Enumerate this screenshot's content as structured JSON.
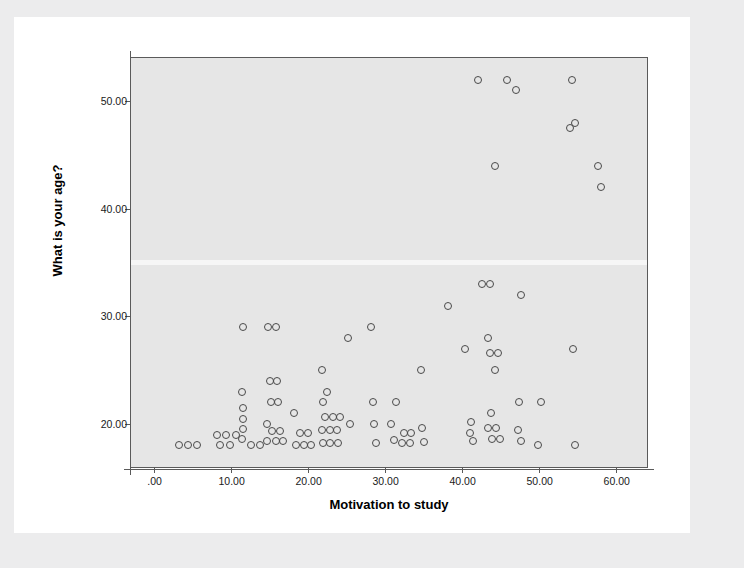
{
  "chart_data": {
    "type": "scatter",
    "title": "",
    "xlabel": "Motivation to study",
    "ylabel": "What is your age?",
    "xlim": [
      -3,
      64
    ],
    "ylim": [
      16,
      54
    ],
    "grid": false,
    "legend": null,
    "xticks": [
      ".00",
      "10.00",
      "20.00",
      "30.00",
      "40.00",
      "50.00",
      "60.00"
    ],
    "xtick_values": [
      0,
      10,
      20,
      30,
      40,
      50,
      60
    ],
    "yticks": [
      "20.00",
      "30.00",
      "40.00",
      "50.00"
    ],
    "ytick_values": [
      20,
      30,
      40,
      50
    ],
    "marker": "open-circle",
    "marker_color": "#4a4a4a",
    "plot_background": "#e6e6e6",
    "points": [
      [
        3.2,
        18
      ],
      [
        4.4,
        18
      ],
      [
        5.6,
        18
      ],
      [
        8.2,
        19
      ],
      [
        9.4,
        19
      ],
      [
        10.6,
        19
      ],
      [
        8.6,
        18
      ],
      [
        9.8,
        18
      ],
      [
        11.6,
        29
      ],
      [
        11.4,
        23
      ],
      [
        11.6,
        21.5
      ],
      [
        11.5,
        20.5
      ],
      [
        11.5,
        19.5
      ],
      [
        11.4,
        18.6
      ],
      [
        12.6,
        18
      ],
      [
        13.8,
        18
      ],
      [
        14.8,
        29
      ],
      [
        15.8,
        29
      ],
      [
        15.0,
        24
      ],
      [
        15.9,
        24
      ],
      [
        15.2,
        22
      ],
      [
        16.1,
        22
      ],
      [
        14.6,
        20
      ],
      [
        15.3,
        19.3
      ],
      [
        16.3,
        19.3
      ],
      [
        14.7,
        18.4
      ],
      [
        15.8,
        18.4
      ],
      [
        16.8,
        18.4
      ],
      [
        18.2,
        21
      ],
      [
        19.0,
        19.2
      ],
      [
        20.0,
        19.2
      ],
      [
        18.4,
        18
      ],
      [
        19.4,
        18
      ],
      [
        20.4,
        18
      ],
      [
        21.8,
        25
      ],
      [
        22.4,
        23
      ],
      [
        21.9,
        22
      ],
      [
        22.2,
        20.6
      ],
      [
        23.2,
        20.6
      ],
      [
        24.2,
        20.6
      ],
      [
        21.8,
        19.4
      ],
      [
        22.8,
        19.4
      ],
      [
        23.8,
        19.4
      ],
      [
        21.9,
        18.2
      ],
      [
        22.9,
        18.2
      ],
      [
        23.9,
        18.2
      ],
      [
        25.2,
        28
      ],
      [
        25.4,
        20
      ],
      [
        28.2,
        29
      ],
      [
        28.4,
        22
      ],
      [
        28.6,
        20
      ],
      [
        28.8,
        18.2
      ],
      [
        30.8,
        20
      ],
      [
        31.2,
        18.5
      ],
      [
        31.4,
        22
      ],
      [
        32.4,
        19.2
      ],
      [
        33.4,
        19.2
      ],
      [
        32.2,
        18.2
      ],
      [
        33.2,
        18.2
      ],
      [
        34.6,
        25
      ],
      [
        34.8,
        19.6
      ],
      [
        35.0,
        18.3
      ],
      [
        38.2,
        31
      ],
      [
        40.4,
        27
      ],
      [
        41.2,
        20.2
      ],
      [
        41.0,
        19.2
      ],
      [
        41.4,
        18.4
      ],
      [
        42.0,
        52
      ],
      [
        42.6,
        33
      ],
      [
        43.6,
        33
      ],
      [
        43.4,
        28
      ],
      [
        43.6,
        26.6
      ],
      [
        44.6,
        26.6
      ],
      [
        44.2,
        25
      ],
      [
        43.8,
        21
      ],
      [
        43.4,
        19.6
      ],
      [
        44.4,
        19.6
      ],
      [
        43.9,
        18.6
      ],
      [
        44.9,
        18.6
      ],
      [
        44.2,
        44
      ],
      [
        45.8,
        52
      ],
      [
        47.0,
        51
      ],
      [
        47.6,
        32
      ],
      [
        47.4,
        22
      ],
      [
        47.2,
        19.4
      ],
      [
        47.6,
        18.4
      ],
      [
        49.8,
        18
      ],
      [
        50.2,
        22
      ],
      [
        54.2,
        52
      ],
      [
        54.0,
        47.5
      ],
      [
        54.6,
        48
      ],
      [
        54.4,
        27
      ],
      [
        54.6,
        18
      ],
      [
        57.6,
        44
      ],
      [
        58.0,
        42
      ]
    ]
  }
}
